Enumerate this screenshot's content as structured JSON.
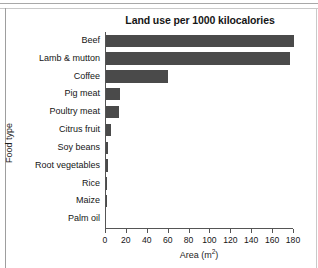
{
  "chart_data": {
    "type": "bar",
    "orientation": "horizontal",
    "title": "Land use per 1000 kilocalories",
    "xlabel": "Area (m²)",
    "ylabel": "Food type",
    "xlim": [
      0,
      180
    ],
    "xticks": [
      0,
      20,
      40,
      60,
      80,
      100,
      120,
      140,
      160,
      180
    ],
    "xtick_labels": [
      "0",
      "20",
      "40",
      "60",
      "80",
      "100",
      "120",
      "140",
      "160",
      "180"
    ],
    "grid": false,
    "legend": false,
    "bar_color": "#4a4a4a",
    "categories": [
      "Beef",
      "Lamb & mutton",
      "Coffee",
      "Pig meat",
      "Poultry meat",
      "Citrus fruit",
      "Soy beans",
      "Root vegetables",
      "Rice",
      "Maize",
      "Palm oil"
    ],
    "values": [
      180,
      176,
      59,
      13,
      12,
      5,
      2,
      2,
      1,
      1,
      0
    ]
  }
}
